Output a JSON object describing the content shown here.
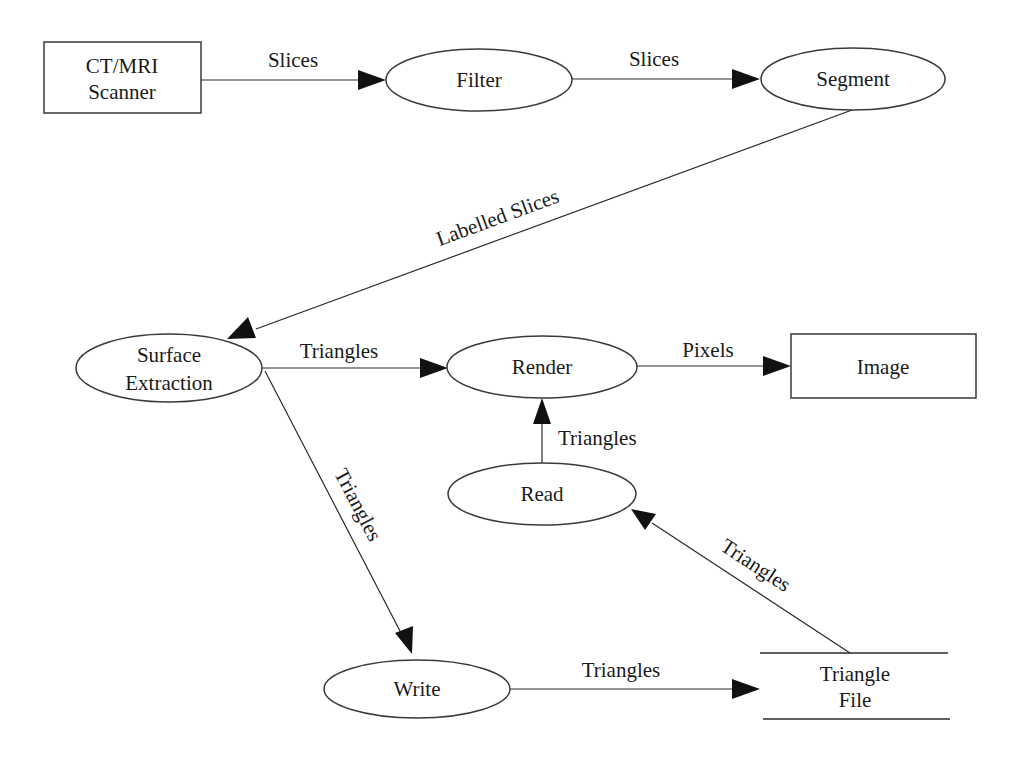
{
  "diagram": {
    "type": "data-flow",
    "nodes": [
      {
        "id": "scanner",
        "shape": "rectangle",
        "lines": [
          "CT/MRI",
          "Scanner"
        ]
      },
      {
        "id": "filter",
        "shape": "ellipse",
        "lines": [
          "Filter"
        ]
      },
      {
        "id": "segment",
        "shape": "ellipse",
        "lines": [
          "Segment"
        ]
      },
      {
        "id": "surface",
        "shape": "ellipse",
        "lines": [
          "Surface",
          "Extraction"
        ]
      },
      {
        "id": "render",
        "shape": "ellipse",
        "lines": [
          "Render"
        ]
      },
      {
        "id": "image",
        "shape": "rectangle",
        "lines": [
          "Image"
        ]
      },
      {
        "id": "read",
        "shape": "ellipse",
        "lines": [
          "Read"
        ]
      },
      {
        "id": "write",
        "shape": "ellipse",
        "lines": [
          "Write"
        ]
      },
      {
        "id": "trianglefile",
        "shape": "data-store",
        "lines": [
          "Triangle",
          "File"
        ]
      }
    ],
    "edges": [
      {
        "from": "scanner",
        "to": "filter",
        "label": "Slices"
      },
      {
        "from": "filter",
        "to": "segment",
        "label": "Slices"
      },
      {
        "from": "segment",
        "to": "surface",
        "label": "Labelled Slices"
      },
      {
        "from": "surface",
        "to": "render",
        "label": "Triangles"
      },
      {
        "from": "render",
        "to": "image",
        "label": "Pixels"
      },
      {
        "from": "read",
        "to": "render",
        "label": "Triangles"
      },
      {
        "from": "surface",
        "to": "write",
        "label": "Triangles"
      },
      {
        "from": "write",
        "to": "trianglefile",
        "label": "Triangles"
      },
      {
        "from": "trianglefile",
        "to": "read",
        "label": "Triangles"
      }
    ]
  }
}
